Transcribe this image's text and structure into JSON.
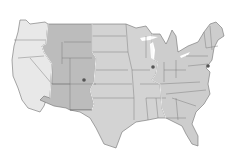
{
  "map": {
    "subject": "Contiguous United States time zones",
    "style": "grayscale",
    "background": "#ffffff",
    "border_color": "#6e6e6e",
    "zones": [
      {
        "name": "Pacific",
        "color": "#e8e8e8"
      },
      {
        "name": "Mountain",
        "color": "#bcbcbc"
      },
      {
        "name": "Central",
        "color": "#d3d3d3"
      },
      {
        "name": "Eastern",
        "color": "#cdcdcd"
      }
    ],
    "markers": [
      {
        "name": "Denver",
        "x": 84,
        "y": 80
      },
      {
        "name": "Chicago",
        "x": 153,
        "y": 67
      },
      {
        "name": "New York",
        "x": 208,
        "y": 66
      }
    ]
  }
}
